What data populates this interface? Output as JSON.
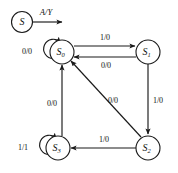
{
  "diagram": {
    "type": "state-transition-diagram",
    "legend": {
      "state_label": "S",
      "state_sub": "",
      "transition_label": "A/Y",
      "description": "generic state with labelled input/output transition"
    },
    "states": [
      {
        "id": "S0",
        "base": "S",
        "sub": "0",
        "cx": 62,
        "cy": 52
      },
      {
        "id": "S1",
        "base": "S",
        "sub": "1",
        "cx": 148,
        "cy": 52
      },
      {
        "id": "S2",
        "base": "S",
        "sub": "2",
        "cx": 148,
        "cy": 148
      },
      {
        "id": "S3",
        "base": "S",
        "sub": "3",
        "cx": 58,
        "cy": 148
      }
    ],
    "transitions": [
      {
        "from": "S0",
        "to": "S1",
        "label": "1/0",
        "kind": "top-right"
      },
      {
        "from": "S1",
        "to": "S0",
        "label": "0/0",
        "kind": "right-left"
      },
      {
        "from": "S1",
        "to": "S2",
        "label": "1/0",
        "kind": "right-down"
      },
      {
        "from": "S2",
        "to": "S3",
        "label": "1/0",
        "kind": "bottom-left"
      },
      {
        "from": "S2",
        "to": "S0",
        "label": "0/0",
        "kind": "diagonal-up-left"
      },
      {
        "from": "S3",
        "to": "S0",
        "label": "0/0",
        "kind": "left-up"
      },
      {
        "from": "S0",
        "to": "S0",
        "label": "0/0",
        "kind": "self-loop-left"
      },
      {
        "from": "S3",
        "to": "S3",
        "label": "1/1",
        "kind": "self-loop-left"
      }
    ]
  }
}
